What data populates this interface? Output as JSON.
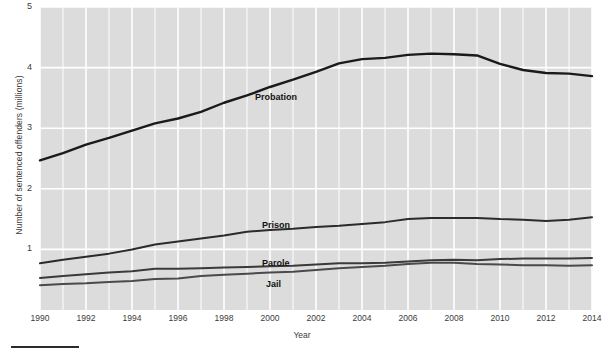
{
  "chart_data": {
    "type": "line",
    "title": "",
    "xlabel": "Year",
    "ylabel": "Number of sentenced offenders (millions)",
    "xlim": [
      1990,
      2014
    ],
    "ylim": [
      0,
      5
    ],
    "xticks": [
      "1990",
      "1992",
      "1994",
      "1996",
      "1998",
      "2000",
      "2002",
      "2004",
      "2006",
      "2008",
      "2010",
      "2012",
      "2014"
    ],
    "yticks": [
      "1",
      "2",
      "3",
      "4",
      "5"
    ],
    "grid": true,
    "legend_position": "inline-labels",
    "x": [
      1990,
      1991,
      1992,
      1993,
      1994,
      1995,
      1996,
      1997,
      1998,
      1999,
      2000,
      2001,
      2002,
      2003,
      2004,
      2005,
      2006,
      2007,
      2008,
      2009,
      2010,
      2011,
      2012,
      2013,
      2014
    ],
    "series": [
      {
        "name": "Probation",
        "color": "#1a1a1a",
        "label_x": 255,
        "label_y": 92,
        "values": [
          2.47,
          2.59,
          2.73,
          2.84,
          2.96,
          3.08,
          3.16,
          3.27,
          3.42,
          3.54,
          3.68,
          3.8,
          3.93,
          4.07,
          4.14,
          4.16,
          4.21,
          4.23,
          4.22,
          4.2,
          4.06,
          3.96,
          3.91,
          3.9,
          3.86
        ]
      },
      {
        "name": "Prison",
        "color": "#2b2b2b",
        "label_x": 262,
        "label_y": 220,
        "values": [
          0.77,
          0.83,
          0.88,
          0.93,
          1.0,
          1.08,
          1.13,
          1.18,
          1.23,
          1.29,
          1.32,
          1.34,
          1.37,
          1.39,
          1.42,
          1.45,
          1.5,
          1.52,
          1.52,
          1.52,
          1.5,
          1.49,
          1.47,
          1.49,
          1.53
        ]
      },
      {
        "name": "Parole",
        "color": "#3a3a3a",
        "label_x": 262,
        "label_y": 258,
        "values": [
          0.53,
          0.56,
          0.59,
          0.62,
          0.64,
          0.68,
          0.68,
          0.69,
          0.7,
          0.71,
          0.72,
          0.73,
          0.75,
          0.77,
          0.77,
          0.78,
          0.8,
          0.82,
          0.83,
          0.82,
          0.84,
          0.85,
          0.85,
          0.85,
          0.86
        ]
      },
      {
        "name": "Jail",
        "color": "#4a4a4a",
        "label_x": 266,
        "label_y": 279,
        "values": [
          0.41,
          0.43,
          0.44,
          0.46,
          0.48,
          0.51,
          0.52,
          0.56,
          0.58,
          0.6,
          0.62,
          0.63,
          0.66,
          0.69,
          0.71,
          0.73,
          0.76,
          0.78,
          0.78,
          0.76,
          0.75,
          0.74,
          0.74,
          0.73,
          0.74
        ]
      }
    ]
  },
  "style": {
    "plot_background": "#dcdcdc",
    "gridline_color": "#ffffff",
    "text_color": "#3b3b3b",
    "rule_color": "#2b2b2b"
  }
}
